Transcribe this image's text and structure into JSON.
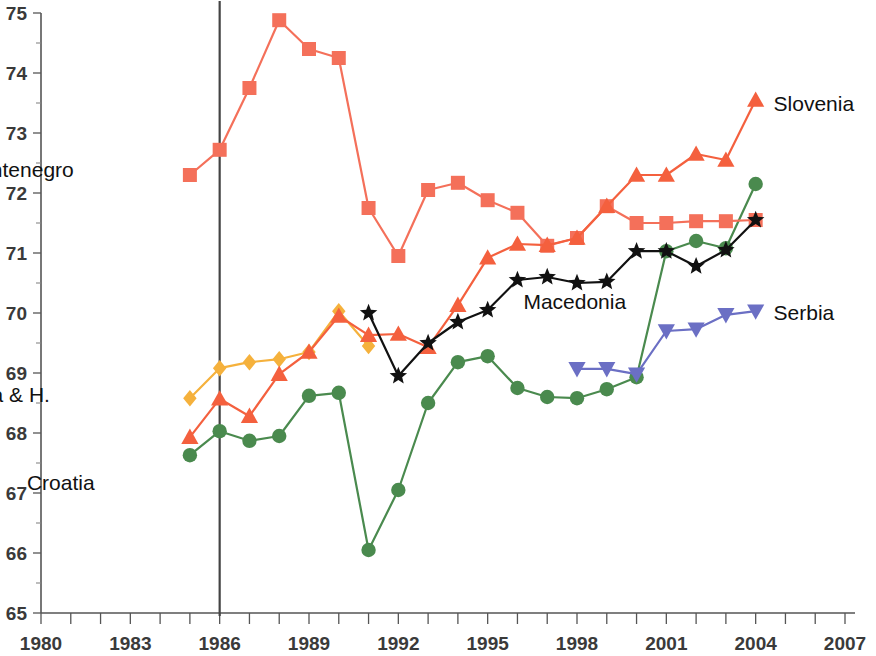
{
  "chart_data": {
    "type": "line",
    "title": "",
    "subtitle": "",
    "xlabel": "",
    "ylabel": "",
    "xlim": [
      1980,
      2007
    ],
    "ylim": [
      65,
      75
    ],
    "grid": false,
    "legend_position": "inline-labels",
    "x_ticks": [
      1980,
      1981,
      1982,
      1983,
      1984,
      1985,
      1986,
      1987,
      1988,
      1989,
      1990,
      1991,
      1992,
      1993,
      1994,
      1995,
      1996,
      1997,
      1998,
      1999,
      2000,
      2001,
      2002,
      2003,
      2004,
      2005,
      2006,
      2007
    ],
    "x_tick_labels": [
      "1980",
      "1983",
      "1986",
      "1989",
      "1992",
      "1995",
      "1998",
      "2001",
      "2004",
      "2007"
    ],
    "x_labeled_values": [
      1980,
      1983,
      1986,
      1989,
      1992,
      1995,
      1998,
      2001,
      2004,
      2007
    ],
    "y_ticks": [
      65,
      66,
      67,
      68,
      69,
      70,
      71,
      72,
      73,
      74,
      75
    ],
    "y_tick_labels": [
      "65",
      "66",
      "67",
      "68",
      "69",
      "70",
      "71",
      "72",
      "73",
      "74",
      "75"
    ],
    "y_minor_ticks": [
      65.5,
      66.5,
      67.5,
      68.5,
      69.5,
      70.5,
      71.5,
      72.5,
      73.5,
      74.5
    ],
    "annotations": [
      {
        "text": "Reference line at 1986",
        "x": 1986,
        "type": "vertical-line"
      }
    ],
    "series": [
      {
        "name": "Montenegro",
        "color": "#F4705A",
        "marker": "square",
        "label_position": "left",
        "label_x": 1981.1,
        "label_y": 72.38,
        "x": [
          1985,
          1986,
          1987,
          1988,
          1989,
          1990,
          1991,
          1992,
          1993,
          1994,
          1995,
          1996,
          1997,
          1998,
          1999,
          2000,
          2001,
          2002,
          2003,
          2004
        ],
        "values": [
          72.3,
          72.72,
          73.75,
          74.88,
          74.4,
          74.25,
          71.75,
          70.95,
          72.05,
          72.17,
          71.88,
          71.67,
          71.12,
          71.25,
          71.78,
          71.5,
          71.5,
          71.53,
          71.53,
          71.55
        ]
      },
      {
        "name": "Slovenia",
        "color": "#F4603E",
        "marker": "triangle-up",
        "label_position": "right",
        "label_x": 2004.6,
        "label_y": 73.48,
        "x": [
          1985,
          1986,
          1987,
          1988,
          1989,
          1990,
          1991,
          1992,
          1993,
          1994,
          1995,
          1996,
          1997,
          1998,
          1999,
          2000,
          2001,
          2002,
          2003,
          2004
        ],
        "values": [
          67.93,
          68.57,
          68.28,
          68.98,
          69.35,
          69.95,
          69.63,
          69.65,
          69.43,
          70.13,
          70.92,
          71.15,
          71.13,
          71.25,
          71.78,
          72.3,
          72.3,
          72.65,
          72.55,
          73.55
        ]
      },
      {
        "name": "Bosnia & H.",
        "color": "#F5B13C",
        "marker": "diamond",
        "label_position": "left",
        "label_x": 1980.3,
        "label_y": 68.63,
        "x": [
          1985,
          1986,
          1987,
          1988,
          1989,
          1990,
          1991
        ],
        "values": [
          68.58,
          69.08,
          69.18,
          69.23,
          69.35,
          70.03,
          69.45
        ]
      },
      {
        "name": "Croatia",
        "color": "#4A8A4E",
        "marker": "circle",
        "label_position": "left",
        "label_x": 1981.8,
        "label_y": 67.17,
        "x": [
          1985,
          1986,
          1987,
          1988,
          1989,
          1990,
          1991,
          1992,
          1993,
          1994,
          1995,
          1996,
          1997,
          1998,
          1999,
          2000,
          2001,
          2002,
          2003,
          2004
        ],
        "values": [
          67.63,
          68.03,
          67.87,
          67.95,
          68.62,
          68.67,
          66.05,
          67.05,
          68.5,
          69.18,
          69.28,
          68.75,
          68.6,
          68.58,
          68.73,
          68.93,
          71.03,
          71.2,
          71.08,
          72.15
        ]
      },
      {
        "name": "Macedonia",
        "color": "#111111",
        "marker": "star",
        "label_position": "right",
        "label_x": 1996.2,
        "label_y": 70.18,
        "x": [
          1991,
          1992,
          1993,
          1994,
          1995,
          1996,
          1997,
          1998,
          1999,
          2000,
          2001,
          2002,
          2003,
          2004
        ],
        "values": [
          70.0,
          68.95,
          69.5,
          69.85,
          70.05,
          70.55,
          70.6,
          70.5,
          70.52,
          71.03,
          71.03,
          70.78,
          71.05,
          71.55
        ]
      },
      {
        "name": "Serbia",
        "color": "#6B6FC4",
        "marker": "triangle-down",
        "label_position": "right",
        "label_x": 2004.6,
        "label_y": 70.0,
        "x": [
          1998,
          1999,
          2000,
          2001,
          2002,
          2003,
          2004
        ],
        "values": [
          69.07,
          69.07,
          68.98,
          69.7,
          69.73,
          69.97,
          70.03
        ]
      }
    ]
  }
}
